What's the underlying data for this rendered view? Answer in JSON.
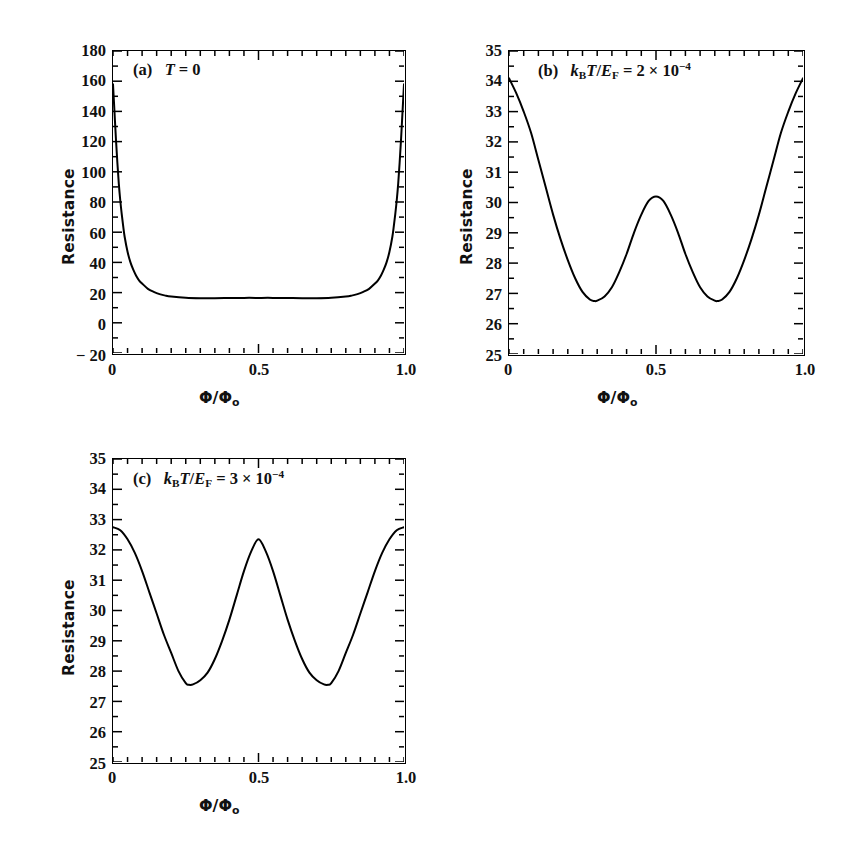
{
  "figure": {
    "background": "#ffffff",
    "line_color": "#000000",
    "axis_color": "#000000"
  },
  "panels": [
    {
      "id": "panel-a",
      "tag": "(a)",
      "annotation_plain": "(a)  T = 0",
      "annotation_html": "(a)&nbsp;&nbsp; <i>T</i> = 0",
      "x_label": "Φ/Φ₀",
      "y_label": "Resistance",
      "x_ticks": [
        "0",
        "0.5",
        "1.0"
      ],
      "y_ticks": [
        "-20",
        "0",
        "20",
        "40",
        "60",
        "80",
        "100",
        "120",
        "140",
        "160",
        "180"
      ]
    },
    {
      "id": "panel-b",
      "tag": "(b)",
      "annotation_plain": "(b)  k_B T/E_F = 2 × 10^-4",
      "annotation_html": "(b)&nbsp;&nbsp; <i>k</i><sub>B</sub><i>T</i>/<i>E</i><sub>F</sub> = 2 × 10<sup>−4</sup>",
      "x_label": "Φ/Φ₀",
      "y_label": "Resistance",
      "x_ticks": [
        "0",
        "0.5",
        "1.0"
      ],
      "y_ticks": [
        "25",
        "26",
        "27",
        "28",
        "29",
        "30",
        "31",
        "32",
        "33",
        "34",
        "35"
      ]
    },
    {
      "id": "panel-c",
      "tag": "(c)",
      "annotation_plain": "(c)  k_B T/E_F = 3 × 10^-4",
      "annotation_html": "(c)&nbsp;&nbsp; <i>k</i><sub>B</sub><i>T</i>/<i>E</i><sub>F</sub> = 3 × 10<sup>−4</sup>",
      "x_label": "Φ/Φ₀",
      "y_label": "Resistance",
      "x_ticks": [
        "0",
        "0.5",
        "1.0"
      ],
      "y_ticks": [
        "25",
        "26",
        "27",
        "28",
        "29",
        "30",
        "31",
        "32",
        "33",
        "34",
        "35"
      ]
    }
  ],
  "chart_data": [
    {
      "type": "line",
      "id": "panel-a",
      "title": "(a)  T = 0",
      "xlabel": "Φ/Φ₀",
      "ylabel": "Resistance",
      "xlim": [
        0,
        1
      ],
      "ylim": [
        -20,
        180
      ],
      "xticks": [
        0,
        0.5,
        1.0
      ],
      "xtick_labels": [
        "0",
        "0.5",
        "1.0"
      ],
      "yticks": [
        -20,
        0,
        20,
        40,
        60,
        80,
        100,
        120,
        140,
        160,
        180
      ],
      "minor_tick_interval_x": 0.05,
      "minor_tick_interval_y": 10,
      "grid": false,
      "legend": false,
      "x": [
        0.0,
        0.005,
        0.01,
        0.015,
        0.02,
        0.025,
        0.03,
        0.035,
        0.04,
        0.05,
        0.06,
        0.07,
        0.08,
        0.09,
        0.1,
        0.12,
        0.14,
        0.16,
        0.18,
        0.2,
        0.25,
        0.3,
        0.35,
        0.4,
        0.45,
        0.5,
        0.55,
        0.6,
        0.65,
        0.7,
        0.75,
        0.8,
        0.82,
        0.84,
        0.86,
        0.88,
        0.9,
        0.91,
        0.92,
        0.93,
        0.94,
        0.95,
        0.96,
        0.965,
        0.97,
        0.975,
        0.98,
        0.985,
        0.99,
        0.995,
        1.0
      ],
      "y": [
        158,
        140,
        122,
        106,
        92,
        81,
        72,
        64,
        57,
        47,
        40,
        35,
        31,
        28,
        26,
        22.5,
        20.5,
        19,
        18,
        17.4,
        16.6,
        16.3,
        16.3,
        16.4,
        16.5,
        16.5,
        16.5,
        16.4,
        16.3,
        16.3,
        16.6,
        17.4,
        18,
        19,
        20.5,
        22.5,
        26,
        28,
        31,
        35,
        40,
        47,
        57,
        64,
        72,
        81,
        92,
        106,
        122,
        140,
        158
      ],
      "notes": "Sharply peaked at Φ/Φ₀ = 0 and 1 (R ≈ 158), broad flat plateau R ≈ 16.3–16.5 between 0.25 and 0.75"
    },
    {
      "type": "line",
      "id": "panel-b",
      "title": "(b)  k_B T/E_F = 2 × 10^-4",
      "xlabel": "Φ/Φ₀",
      "ylabel": "Resistance",
      "xlim": [
        0,
        1
      ],
      "ylim": [
        25,
        35
      ],
      "xticks": [
        0,
        0.5,
        1.0
      ],
      "xtick_labels": [
        "0",
        "0.5",
        "1.0"
      ],
      "yticks": [
        25,
        26,
        27,
        28,
        29,
        30,
        31,
        32,
        33,
        34,
        35
      ],
      "minor_tick_interval_x": 0.05,
      "minor_tick_interval_y": 0.5,
      "grid": false,
      "legend": false,
      "x": [
        0.0,
        0.025,
        0.05,
        0.075,
        0.1,
        0.125,
        0.15,
        0.175,
        0.2,
        0.225,
        0.25,
        0.275,
        0.29,
        0.3,
        0.325,
        0.35,
        0.375,
        0.4,
        0.425,
        0.45,
        0.475,
        0.5,
        0.525,
        0.55,
        0.575,
        0.6,
        0.625,
        0.65,
        0.675,
        0.7,
        0.71,
        0.725,
        0.75,
        0.775,
        0.8,
        0.825,
        0.85,
        0.875,
        0.9,
        0.925,
        0.95,
        0.975,
        1.0
      ],
      "y": [
        34.1,
        33.6,
        33.0,
        32.3,
        31.4,
        30.5,
        29.6,
        28.8,
        28.1,
        27.5,
        27.05,
        26.8,
        26.75,
        26.76,
        26.9,
        27.2,
        27.7,
        28.3,
        29.0,
        29.6,
        30.05,
        30.2,
        30.05,
        29.6,
        29.0,
        28.3,
        27.7,
        27.2,
        26.9,
        26.76,
        26.75,
        26.8,
        27.05,
        27.5,
        28.1,
        28.8,
        29.6,
        30.5,
        31.4,
        32.3,
        33.0,
        33.6,
        34.1
      ],
      "notes": "Two minima R ≈ 26.75 at Φ/Φ₀ ≈ 0.29 and 0.71; central maximum R ≈ 30.2 at 0.5; edge values R ≈ 34.1"
    },
    {
      "type": "line",
      "id": "panel-c",
      "title": "(c)  k_B T/E_F = 3 × 10^-4",
      "xlabel": "Φ/Φ₀",
      "ylabel": "Resistance",
      "xlim": [
        0,
        1
      ],
      "ylim": [
        25,
        35
      ],
      "xticks": [
        0,
        0.5,
        1.0
      ],
      "xtick_labels": [
        "0",
        "0.5",
        "1.0"
      ],
      "yticks": [
        25,
        26,
        27,
        28,
        29,
        30,
        31,
        32,
        33,
        34,
        35
      ],
      "minor_tick_interval_x": 0.05,
      "minor_tick_interval_y": 0.5,
      "grid": false,
      "legend": false,
      "x": [
        0.0,
        0.025,
        0.05,
        0.075,
        0.1,
        0.125,
        0.15,
        0.175,
        0.2,
        0.225,
        0.25,
        0.26,
        0.275,
        0.3,
        0.325,
        0.35,
        0.375,
        0.4,
        0.425,
        0.45,
        0.475,
        0.5,
        0.525,
        0.55,
        0.575,
        0.6,
        0.625,
        0.65,
        0.675,
        0.7,
        0.725,
        0.74,
        0.75,
        0.775,
        0.8,
        0.825,
        0.85,
        0.875,
        0.9,
        0.925,
        0.95,
        0.975,
        1.0
      ],
      "y": [
        32.75,
        32.65,
        32.35,
        31.9,
        31.3,
        30.6,
        29.9,
        29.2,
        28.6,
        28.0,
        27.6,
        27.55,
        27.56,
        27.7,
        27.95,
        28.4,
        29.0,
        29.7,
        30.5,
        31.3,
        31.95,
        32.35,
        31.95,
        31.3,
        30.5,
        29.7,
        29.0,
        28.4,
        27.95,
        27.7,
        27.56,
        27.55,
        27.6,
        28.0,
        28.6,
        29.2,
        29.9,
        30.6,
        31.3,
        31.9,
        32.35,
        32.65,
        32.75
      ],
      "notes": "Two minima R ≈ 27.55 at Φ/Φ₀ ≈ 0.26 and 0.74; central maximum R ≈ 32.35 at 0.5; edge values R ≈ 32.75"
    }
  ]
}
